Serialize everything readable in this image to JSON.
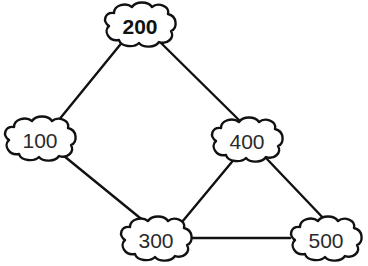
{
  "diagram": {
    "type": "graph",
    "colors": {
      "stroke": "#111111",
      "fill": "#ffffff",
      "text": "#2a2a2a"
    },
    "nodes": [
      {
        "id": "n200",
        "label": "200",
        "bold": true,
        "cx": 140,
        "cy": 25
      },
      {
        "id": "n100",
        "label": "100",
        "bold": false,
        "cx": 40,
        "cy": 139
      },
      {
        "id": "n400",
        "label": "400",
        "bold": false,
        "cx": 247,
        "cy": 140
      },
      {
        "id": "n300",
        "label": "300",
        "bold": false,
        "cx": 156,
        "cy": 239
      },
      {
        "id": "n500",
        "label": "500",
        "bold": false,
        "cx": 326,
        "cy": 239
      }
    ],
    "edges": [
      {
        "from": "200",
        "to": "100"
      },
      {
        "from": "200",
        "to": "400"
      },
      {
        "from": "100",
        "to": "300"
      },
      {
        "from": "400",
        "to": "300"
      },
      {
        "from": "400",
        "to": "500"
      },
      {
        "from": "300",
        "to": "500"
      }
    ]
  }
}
